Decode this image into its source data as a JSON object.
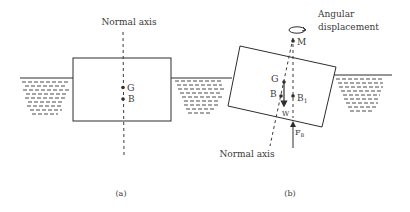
{
  "figure": {
    "panel_a": {
      "axis_label": "Normal axis",
      "point_g": "G",
      "point_b": "B",
      "caption": "(a)"
    },
    "panel_b": {
      "rotation_label_line1": "Angular",
      "rotation_label_line2": "displacement",
      "point_m": "M",
      "point_g": "G",
      "point_b": "B",
      "point_b1": "B",
      "point_b1_sub": "1",
      "weight_label": "W",
      "buoyancy_label": "F",
      "buoyancy_sub": "B",
      "axis_label": "Normal axis",
      "caption": "(b)"
    },
    "colors": {
      "line": "#2e2e2e",
      "text": "#3a3a3a",
      "background": "#ffffff"
    }
  }
}
